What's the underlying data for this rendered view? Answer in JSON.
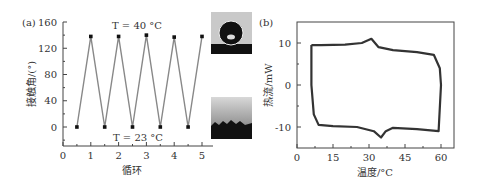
{
  "figure": {
    "panel_a_label": "(a)",
    "panel_b_label": "(b)",
    "annotation_high": "T = 40 °C",
    "annotation_low": "T = 23 °C",
    "inset_top": "water-droplet-hydrophobic-image",
    "inset_bottom": "water-spread-hydrophilic-image"
  },
  "chart_data": [
    {
      "type": "line",
      "title": "",
      "panel": "(a)",
      "xlabel": "循环",
      "ylabel": "接触角/(°)",
      "xlim": [
        0,
        5.3
      ],
      "ylim": [
        -30,
        160
      ],
      "xticks": [
        "0",
        "1",
        "2",
        "3",
        "4",
        "5"
      ],
      "yticks": [
        "0",
        "40",
        "80",
        "120",
        "160"
      ],
      "x": [
        0.5,
        1,
        1.5,
        2,
        2.5,
        3,
        3.5,
        4,
        4.5,
        5
      ],
      "values": [
        0,
        138,
        0,
        138,
        0,
        140,
        0,
        137,
        0,
        138
      ],
      "annotations": [
        "T=40 °C",
        "T=23 °C"
      ],
      "grid": false,
      "color": "#888888"
    },
    {
      "type": "line",
      "title": "",
      "panel": "(b)",
      "xlabel": "温度/°C",
      "ylabel": "热流/mW",
      "xlim": [
        0,
        65
      ],
      "ylim": [
        -15,
        15
      ],
      "xticks": [
        "0",
        "15",
        "30",
        "45",
        "60"
      ],
      "yticks": [
        "-10",
        "0",
        "10"
      ],
      "series": [
        {
          "name": "heating",
          "x": [
            6,
            10,
            20,
            27,
            31,
            34,
            40,
            50,
            57,
            59.5,
            60
          ],
          "values": [
            9.5,
            9.5,
            9.6,
            10.0,
            11.0,
            9.0,
            8.3,
            7.8,
            7.2,
            4,
            0
          ]
        },
        {
          "name": "cooling",
          "x": [
            60,
            59,
            50,
            40,
            37,
            35,
            32,
            25,
            15,
            9,
            7,
            6
          ],
          "values": [
            0,
            -11,
            -10.5,
            -10.2,
            -11,
            -12.5,
            -11,
            -10,
            -9.8,
            -9.5,
            -7,
            0
          ]
        }
      ],
      "grid": false,
      "color": "#333333"
    }
  ]
}
